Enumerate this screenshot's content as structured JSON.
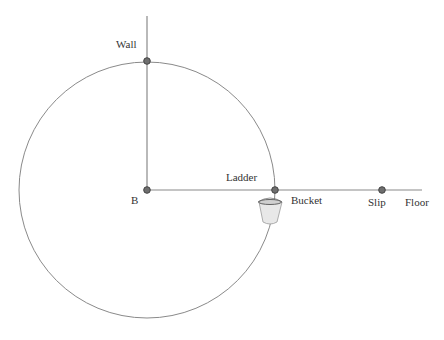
{
  "diagram": {
    "labels": {
      "wall": "Wall",
      "base": "B",
      "ladder": "Ladder",
      "bucket": "Bucket",
      "slip": "Slip",
      "floor": "Floor"
    },
    "colors": {
      "line": "#888888",
      "point_fill": "#6e6e6e",
      "point_stroke": "#444444",
      "bucket_fill": "#e6e6e6",
      "text": "#333333"
    }
  }
}
